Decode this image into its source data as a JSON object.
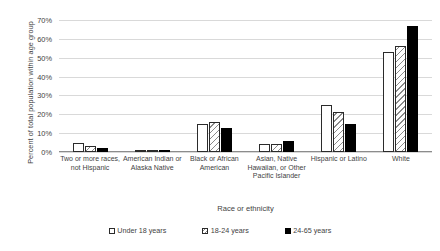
{
  "chart_data": {
    "type": "bar",
    "title": "",
    "xlabel": "Race or ethnicity",
    "ylabel": "Percent of total population within age group",
    "categories": [
      "Two or more races, not Hispanic",
      "American Indian or Alaska Native",
      "Black or African American",
      "Asian, Native Hawaiian, or Other Pacific Islander",
      "Hispanic or Latino",
      "White"
    ],
    "series": [
      {
        "name": "Under 18 years",
        "values": [
          5,
          1,
          15,
          4,
          25,
          53
        ]
      },
      {
        "name": "18-24 years",
        "values": [
          3,
          1,
          16,
          4,
          21,
          56
        ]
      },
      {
        "name": "24-65 years",
        "values": [
          2,
          1,
          13,
          6,
          15,
          67
        ]
      }
    ],
    "ylim": [
      0,
      70
    ],
    "yticks": [
      0,
      10,
      20,
      30,
      40,
      50,
      60,
      70
    ],
    "ytick_labels": [
      "0%",
      "10%",
      "20%",
      "30%",
      "40%",
      "50%",
      "60%",
      "70%"
    ],
    "grid": true,
    "legend_position": "bottom",
    "colors": {
      "series_0": "#ffffff",
      "series_1": "#e0e0e0",
      "series_2": "#000000",
      "bar_outline": "#2b2b2b",
      "gridline": "#d9d9d9",
      "axis": "#8c8c8c",
      "text": "#3f3f3f",
      "background": "#ffffff"
    }
  },
  "axes": {
    "y_title": "Percent of total population within age group",
    "x_title": "Race or ethnicity"
  },
  "category_labels": [
    "Two or more races, not Hispanic",
    "American Indian or Alaska Native",
    "Black or African American",
    "Asian, Native Hawaiian, or Other Pacific Islander",
    "Hispanic or Latino",
    "White"
  ],
  "legend": {
    "items": [
      {
        "label": "Under 18 years"
      },
      {
        "label": "18-24 years"
      },
      {
        "label": "24-65 years"
      }
    ]
  }
}
